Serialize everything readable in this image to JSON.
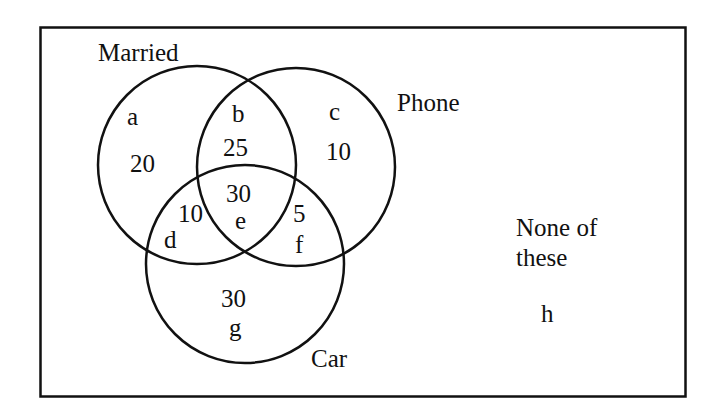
{
  "diagram": {
    "type": "venn",
    "colors": {
      "stroke": "#111111",
      "background": "#ffffff"
    },
    "sets": [
      {
        "name": "Married",
        "label": "Married"
      },
      {
        "name": "Phone",
        "label": "Phone"
      },
      {
        "name": "Car",
        "label": "Car"
      }
    ],
    "outside_label_line1": "None of",
    "outside_label_line2": "these",
    "regions": {
      "a": {
        "letter": "a",
        "value": "20",
        "sets": [
          "Married"
        ]
      },
      "b": {
        "letter": "b",
        "value": "25",
        "sets": [
          "Married",
          "Phone"
        ]
      },
      "c": {
        "letter": "c",
        "value": "10",
        "sets": [
          "Phone"
        ]
      },
      "d": {
        "letter": "d",
        "value": "10",
        "sets": [
          "Married",
          "Car"
        ]
      },
      "e": {
        "letter": "e",
        "value": "30",
        "sets": [
          "Married",
          "Phone",
          "Car"
        ]
      },
      "f": {
        "letter": "f",
        "value": "5",
        "sets": [
          "Phone",
          "Car"
        ]
      },
      "g": {
        "letter": "g",
        "value": "30",
        "sets": [
          "Car"
        ]
      },
      "h": {
        "letter": "h",
        "value": "",
        "sets": []
      }
    }
  }
}
